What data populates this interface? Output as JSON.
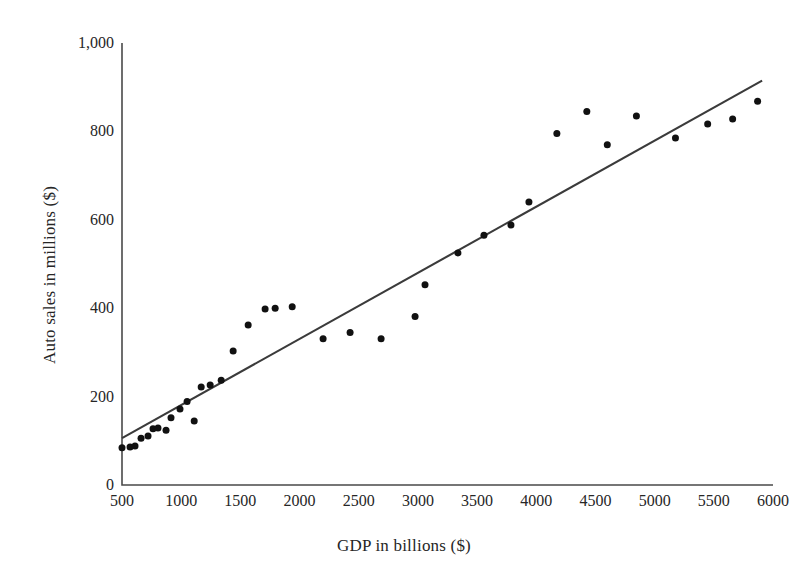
{
  "chart_data": {
    "type": "scatter",
    "title": "",
    "xlabel": "GDP in billions ($)",
    "ylabel": "Auto sales in millions ($)",
    "xlim": [
      500,
      6000
    ],
    "ylim": [
      0,
      1000
    ],
    "xticks": [
      500,
      1000,
      1500,
      2000,
      2500,
      3000,
      3500,
      4000,
      4500,
      5000,
      5500,
      6000
    ],
    "yticks": [
      0,
      200,
      400,
      600,
      800,
      1000
    ],
    "xtick_labels": [
      "500",
      "1000",
      "1500",
      "2000",
      "2500",
      "3000",
      "3500",
      "4000",
      "4500",
      "5000",
      "5500",
      "6000"
    ],
    "ytick_labels": [
      "0",
      "200",
      "400",
      "600",
      "800",
      "1,000"
    ],
    "grid": false,
    "legend": null,
    "marker_color": "#111111",
    "line_color": "#3b3b3b",
    "axis_color": "#4a4a4a",
    "points": [
      {
        "x": 500,
        "y": 84
      },
      {
        "x": 568,
        "y": 86
      },
      {
        "x": 610,
        "y": 88
      },
      {
        "x": 661,
        "y": 106
      },
      {
        "x": 720,
        "y": 111
      },
      {
        "x": 762,
        "y": 127
      },
      {
        "x": 804,
        "y": 129
      },
      {
        "x": 872,
        "y": 124
      },
      {
        "x": 914,
        "y": 152
      },
      {
        "x": 990,
        "y": 172
      },
      {
        "x": 1050,
        "y": 189
      },
      {
        "x": 1110,
        "y": 145
      },
      {
        "x": 1169,
        "y": 222
      },
      {
        "x": 1245,
        "y": 226
      },
      {
        "x": 1338,
        "y": 237
      },
      {
        "x": 1439,
        "y": 303
      },
      {
        "x": 1566,
        "y": 362
      },
      {
        "x": 1709,
        "y": 398
      },
      {
        "x": 1794,
        "y": 400
      },
      {
        "x": 1938,
        "y": 403
      },
      {
        "x": 2199,
        "y": 331
      },
      {
        "x": 2427,
        "y": 345
      },
      {
        "x": 2689,
        "y": 331
      },
      {
        "x": 2976,
        "y": 381
      },
      {
        "x": 3060,
        "y": 453
      },
      {
        "x": 3338,
        "y": 525
      },
      {
        "x": 3558,
        "y": 565
      },
      {
        "x": 3786,
        "y": 588
      },
      {
        "x": 3938,
        "y": 640
      },
      {
        "x": 4174,
        "y": 795
      },
      {
        "x": 4427,
        "y": 845
      },
      {
        "x": 4600,
        "y": 770
      },
      {
        "x": 4846,
        "y": 835
      },
      {
        "x": 5176,
        "y": 785
      },
      {
        "x": 5448,
        "y": 817
      },
      {
        "x": 5659,
        "y": 828
      },
      {
        "x": 5870,
        "y": 868
      }
    ],
    "fit_line": {
      "x_start": 500,
      "y_start": 106,
      "x_end": 5908,
      "y_end": 915
    }
  }
}
